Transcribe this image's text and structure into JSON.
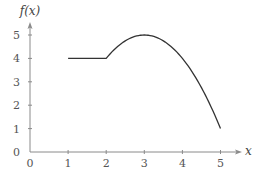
{
  "chart_data": {
    "type": "line",
    "title": "",
    "xlabel": "x",
    "ylabel": "f(x)",
    "xlim": [
      0,
      5
    ],
    "ylim": [
      0,
      5
    ],
    "x_ticks": [
      0,
      1,
      2,
      3,
      4,
      5
    ],
    "y_ticks": [
      0,
      1,
      2,
      3,
      4,
      5
    ],
    "x_tick_labels": [
      "0",
      "1",
      "2",
      "3",
      "4",
      "5"
    ],
    "y_tick_labels": [
      "0",
      "1",
      "2",
      "3",
      "4",
      "5"
    ],
    "grid": false,
    "legend": null,
    "series": [
      {
        "name": "f(x)",
        "description": "Piecewise: constant 4 on [1,2], then downward parabola 5-(x-3)^2 on [2,5]",
        "x": [
          1,
          2,
          2.25,
          2.5,
          2.75,
          3,
          3.25,
          3.5,
          3.75,
          4,
          4.25,
          4.5,
          4.75,
          5
        ],
        "y": [
          4,
          4,
          4.4375,
          4.75,
          4.9375,
          5,
          4.9375,
          4.75,
          4.4375,
          4,
          3.4375,
          2.75,
          1.9375,
          1
        ]
      }
    ],
    "colors": {
      "axis": "#8a8a8a",
      "curve": "#333333",
      "text": "#555555"
    }
  },
  "labels": {
    "x_axis": "x",
    "y_axis": "f(x)"
  }
}
